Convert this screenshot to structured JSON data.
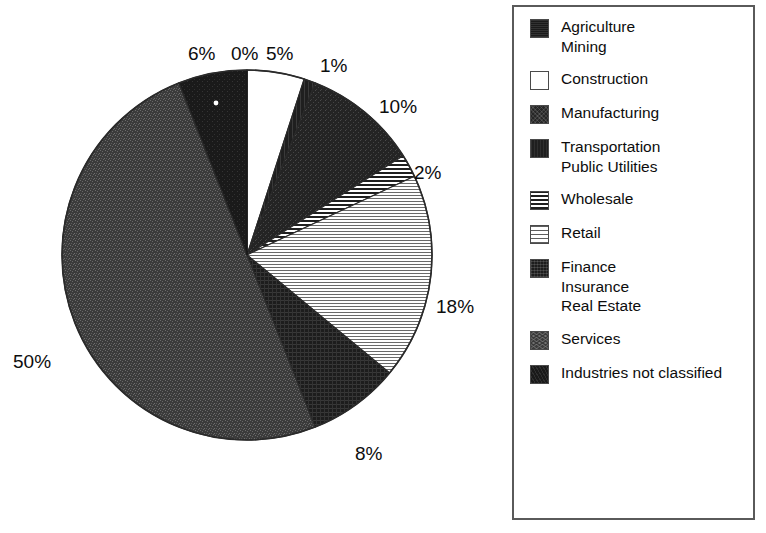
{
  "chart_data": {
    "type": "pie",
    "title": "",
    "subtitle": "",
    "xlabel": "",
    "ylabel": "",
    "grid": false,
    "legend_position": "right",
    "start_angle_deg": 0,
    "direction": "clockwise",
    "center": {
      "x": 247,
      "y": 255
    },
    "radius": 185,
    "categories": [
      "Agriculture\nMining",
      "Construction",
      "Manufacturing",
      "Transportation\nPublic Utilities",
      "Wholesale",
      "Retail",
      "Finance\nInsurance\nReal Estate",
      "Services",
      "Industries not classified"
    ],
    "values": [
      0,
      5,
      10,
      1,
      2,
      18,
      8,
      50,
      6
    ],
    "value_labels": [
      "0%",
      "5%",
      "10%",
      "1%",
      "2%",
      "18%",
      "8%",
      "50%",
      "6%"
    ],
    "slices": [
      {
        "label": "Agriculture Mining",
        "value": 0,
        "display": "0%",
        "pattern": "solid-black",
        "start_deg": 0.0,
        "end_deg": 0.0
      },
      {
        "label": "Construction",
        "value": 5,
        "display": "5%",
        "pattern": "white",
        "start_deg": 0.0,
        "end_deg": 18.0
      },
      {
        "label": "Transportation Public Utilities",
        "value": 1,
        "display": "1%",
        "pattern": "dark-solid",
        "start_deg": 18.0,
        "end_deg": 21.6
      },
      {
        "label": "Manufacturing",
        "value": 10,
        "display": "10%",
        "pattern": "dark-speckle",
        "start_deg": 21.6,
        "end_deg": 57.6
      },
      {
        "label": "Wholesale",
        "value": 2,
        "display": "2%",
        "pattern": "hstripe-dark",
        "start_deg": 57.6,
        "end_deg": 64.8
      },
      {
        "label": "Retail",
        "value": 18,
        "display": "18%",
        "pattern": "hstripe-light",
        "start_deg": 64.8,
        "end_deg": 129.6
      },
      {
        "label": "Finance Insurance Real Estate",
        "value": 8,
        "display": "8%",
        "pattern": "crosshatch",
        "start_deg": 129.6,
        "end_deg": 158.4
      },
      {
        "label": "Services",
        "value": 50,
        "display": "50%",
        "pattern": "midgray-speckle",
        "start_deg": 158.4,
        "end_deg": 338.4
      },
      {
        "label": "Industries not classified",
        "value": 6,
        "display": "6%",
        "pattern": "darkest",
        "start_deg": 338.4,
        "end_deg": 360.0
      }
    ]
  },
  "pie_labels": [
    {
      "text": "6%",
      "left": 188,
      "top": 44
    },
    {
      "text": "0%",
      "left": 231,
      "top": 44
    },
    {
      "text": "5%",
      "left": 266,
      "top": 44
    },
    {
      "text": "1%",
      "left": 320,
      "top": 56
    },
    {
      "text": "10%",
      "left": 379,
      "top": 97
    },
    {
      "text": "2%",
      "left": 414,
      "top": 163
    },
    {
      "text": "18%",
      "left": 436,
      "top": 297
    },
    {
      "text": "8%",
      "left": 355,
      "top": 444
    },
    {
      "text": "50%",
      "left": 13,
      "top": 352
    }
  ],
  "legend": {
    "items": [
      {
        "label": "Agriculture\nMining",
        "swatch": "sw-solid-black",
        "icon": "legend-swatch-agriculture-mining"
      },
      {
        "label": "Construction",
        "swatch": "sw-white",
        "icon": "legend-swatch-construction"
      },
      {
        "label": "Manufacturing",
        "swatch": "sw-dark-speckle",
        "icon": "legend-swatch-manufacturing"
      },
      {
        "label": "Transportation\nPublic Utilities",
        "swatch": "sw-dark-solid",
        "icon": "legend-swatch-transportation-public-utilities"
      },
      {
        "label": "Wholesale",
        "swatch": "sw-hstripe-dark",
        "icon": "legend-swatch-wholesale"
      },
      {
        "label": "Retail",
        "swatch": "sw-hstripe-light",
        "icon": "legend-swatch-retail"
      },
      {
        "label": "Finance\nInsurance\nReal Estate",
        "swatch": "sw-crosshatch",
        "icon": "legend-swatch-finance-insurance-real-estate"
      },
      {
        "label": "Services",
        "swatch": "sw-midgray-speckle",
        "icon": "legend-swatch-services"
      },
      {
        "label": "Industries not classified",
        "swatch": "sw-darkest",
        "icon": "legend-swatch-industries-not-classified"
      }
    ]
  },
  "colors": {
    "background": "#ffffff",
    "ink": "#0d0d0d",
    "legend_border": "#5a5a5a",
    "pie_outline": "#2a2a2a"
  }
}
